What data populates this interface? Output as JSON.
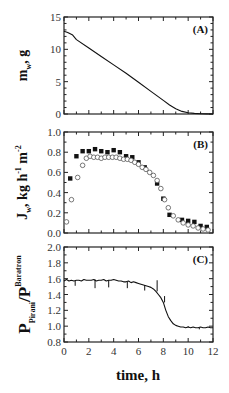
{
  "chart_data": [
    {
      "type": "line",
      "panel": "A",
      "panel_label": "(A)",
      "ylabel": {
        "main": "m",
        "sub": "w",
        "rest": ", g"
      },
      "xlabel": "",
      "xlim": [
        0,
        12
      ],
      "ylim": [
        0,
        15
      ],
      "yticks": [
        0,
        5,
        10,
        15
      ],
      "ytick_labels": [
        "0",
        "5",
        "10",
        "15"
      ],
      "y_minor_step": 1,
      "x_minor_step": 1,
      "series": [
        {
          "name": "m_w",
          "style": "line",
          "x": [
            0,
            0.3,
            0.7,
            1.0,
            2.0,
            3.0,
            4.0,
            5.0,
            6.0,
            7.0,
            7.5,
            8.0,
            8.5,
            9.0,
            9.5,
            10.0,
            10.5,
            11.0,
            11.5,
            12.0
          ],
          "y": [
            12.8,
            12.6,
            12.2,
            11.5,
            10.2,
            8.9,
            7.6,
            6.3,
            4.9,
            3.5,
            2.8,
            2.1,
            1.4,
            0.8,
            0.4,
            0.2,
            0.1,
            0.05,
            0.02,
            0.0
          ]
        }
      ]
    },
    {
      "type": "scatter",
      "panel": "B",
      "panel_label": "(B)",
      "ylabel": {
        "main": "J",
        "sub": "w",
        "rest": ", kg h",
        "sup1": "-1",
        "rest2": " m",
        "sup2": "-2"
      },
      "xlabel": "",
      "xlim": [
        0,
        12
      ],
      "ylim": [
        0,
        1.0
      ],
      "yticks": [
        0.0,
        0.2,
        0.4,
        0.6,
        0.8,
        1.0
      ],
      "ytick_labels": [
        "0.0",
        "0.2",
        "0.4",
        "0.6",
        "0.8",
        "1.0"
      ],
      "y_minor_step": 0.1,
      "x_minor_step": 1,
      "series": [
        {
          "name": "filled-squares",
          "marker": "square-filled",
          "x": [
            0.5,
            1.0,
            1.5,
            2.0,
            2.5,
            3.0,
            3.5,
            4.0,
            4.5,
            5.0,
            5.5,
            6.0,
            6.5,
            7.5,
            8.0,
            8.5,
            9.5,
            10.0,
            10.5,
            11.0,
            11.5
          ],
          "y": [
            0.54,
            0.76,
            0.81,
            0.81,
            0.83,
            0.81,
            0.8,
            0.82,
            0.8,
            0.76,
            0.75,
            0.7,
            0.65,
            0.49,
            0.34,
            0.18,
            0.13,
            0.12,
            0.11,
            0.07,
            0.06
          ]
        },
        {
          "name": "open-circles",
          "marker": "circle-open",
          "x": [
            0.2,
            0.6,
            1.1,
            1.5,
            1.8,
            2.1,
            2.4,
            2.7,
            3.0,
            3.3,
            3.6,
            3.9,
            4.2,
            4.5,
            4.8,
            5.1,
            5.4,
            5.7,
            6.0,
            6.3,
            6.6,
            6.9,
            7.2,
            7.5,
            7.8,
            8.1,
            8.4,
            8.8,
            9.2,
            9.6,
            10.0,
            10.4,
            10.8,
            11.2,
            11.6
          ],
          "y": [
            0.11,
            0.33,
            0.55,
            0.67,
            0.74,
            0.76,
            0.75,
            0.75,
            0.74,
            0.75,
            0.75,
            0.75,
            0.75,
            0.74,
            0.73,
            0.73,
            0.72,
            0.7,
            0.68,
            0.65,
            0.63,
            0.6,
            0.57,
            0.52,
            0.44,
            0.33,
            0.25,
            0.17,
            0.13,
            0.1,
            0.08,
            0.07,
            0.05,
            0.04,
            0.03
          ]
        }
      ]
    },
    {
      "type": "line",
      "panel": "C",
      "panel_label": "(C)",
      "ylabel": {
        "main": "P",
        "sub": "Pirani",
        "rest": "/P",
        "sub2": "Baratron"
      },
      "xlabel": "time, h",
      "xlim": [
        0,
        12
      ],
      "ylim": [
        0.8,
        2.0
      ],
      "yticks": [
        0.8,
        1.0,
        1.2,
        1.4,
        1.6,
        1.8,
        2.0
      ],
      "ytick_labels": [
        "0.8",
        "1.0",
        "1.2",
        "1.4",
        "1.6",
        "1.8",
        "2.0"
      ],
      "xticks": [
        0,
        2,
        4,
        6,
        8,
        10,
        12
      ],
      "xtick_labels": [
        "0",
        "2",
        "4",
        "6",
        "8",
        "10",
        "12"
      ],
      "y_minor_step": 0.1,
      "x_minor_step": 1,
      "series": [
        {
          "name": "pressure-ratio",
          "style": "line",
          "x": [
            0,
            0.2,
            0.4,
            0.6,
            0.8,
            1.0,
            1.2,
            1.4,
            1.6,
            1.8,
            2.0,
            2.2,
            2.4,
            2.6,
            2.8,
            3.0,
            3.2,
            3.4,
            3.6,
            3.8,
            4.0,
            4.2,
            4.4,
            4.6,
            4.8,
            5.0,
            5.2,
            5.4,
            5.6,
            5.8,
            6.0,
            6.2,
            6.4,
            6.6,
            6.8,
            7.0,
            7.2,
            7.4,
            7.6,
            7.8,
            8.0,
            8.2,
            8.4,
            8.6,
            8.8,
            9.0,
            9.2,
            9.4,
            9.6,
            9.8,
            10.0,
            10.2,
            10.4,
            10.6,
            10.8,
            11.0,
            11.2,
            11.4,
            11.6,
            11.8,
            12.0
          ],
          "y": [
            1.57,
            1.59,
            1.57,
            1.58,
            1.57,
            1.58,
            1.58,
            1.57,
            1.59,
            1.58,
            1.58,
            1.58,
            1.59,
            1.57,
            1.58,
            1.58,
            1.59,
            1.57,
            1.58,
            1.58,
            1.59,
            1.58,
            1.57,
            1.57,
            1.56,
            1.56,
            1.57,
            1.55,
            1.56,
            1.55,
            1.54,
            1.53,
            1.52,
            1.51,
            1.5,
            1.49,
            1.47,
            1.44,
            1.4,
            1.36,
            1.3,
            1.2,
            1.12,
            1.07,
            1.03,
            1.01,
            1.0,
            0.99,
            0.99,
            0.98,
            0.99,
            0.98,
            0.99,
            0.98,
            0.98,
            0.99,
            0.98,
            0.98,
            0.99,
            0.98,
            0.98
          ]
        }
      ],
      "spikes": {
        "x": [
          0.9,
          2.5,
          3.6,
          5.1,
          6.5,
          7.5,
          8.1,
          10.0,
          10.9
        ],
        "y": [
          1.51,
          1.48,
          1.49,
          1.48,
          1.45,
          1.58,
          1.38,
          1.0,
          0.96
        ]
      }
    }
  ]
}
